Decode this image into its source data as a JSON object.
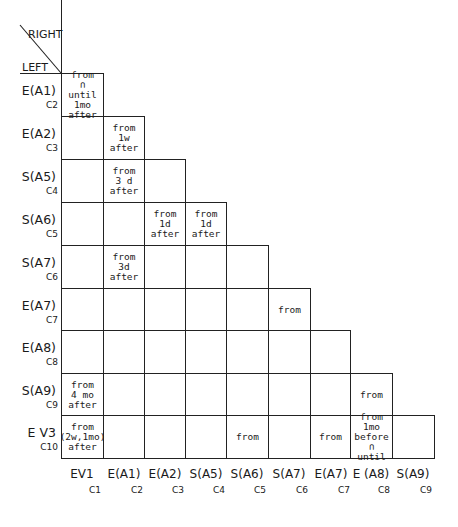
{
  "corner": {
    "right_label": "RIGHT",
    "left_label": "LEFT"
  },
  "rows": [
    {
      "label": "E(A1)",
      "sub": "C2"
    },
    {
      "label": "E(A2)",
      "sub": "C3"
    },
    {
      "label": "S(A5)",
      "sub": "C4"
    },
    {
      "label": "S(A6)",
      "sub": "C5"
    },
    {
      "label": "S(A7)",
      "sub": "C6"
    },
    {
      "label": "E(A7)",
      "sub": "C7"
    },
    {
      "label": "E(A8)",
      "sub": "C8"
    },
    {
      "label": "S(A9)",
      "sub": "C9"
    },
    {
      "label": "E V3",
      "sub": "C10"
    }
  ],
  "columns": [
    {
      "label": "EV1",
      "sub": "C1"
    },
    {
      "label": "E(A1)",
      "sub": "C2"
    },
    {
      "label": "E(A2)",
      "sub": "C3"
    },
    {
      "label": "S(A5)",
      "sub": "C4"
    },
    {
      "label": "S(A6)",
      "sub": "C5"
    },
    {
      "label": "S(A7)",
      "sub": "C6"
    },
    {
      "label": "E(A7)",
      "sub": "C7"
    },
    {
      "label": "E (A8)",
      "sub": "C8"
    },
    {
      "label": "S(A9)",
      "sub": "C9"
    }
  ],
  "cells": {
    "r0c0": "from\n∩\nuntil 1mo\nafter",
    "r1c1": "from 1w\nafter",
    "r2c1": "from\n3 d\nafter",
    "r3c2": "from\n1d\nafter",
    "r3c3": "from\n1d\nafter",
    "r4c1": "from\n3d\nafter",
    "r5c5": "from",
    "r7c0": "from\n4 mo\nafter",
    "r7c7": "from",
    "r8c0": "from\n(2w,1mo)\nafter",
    "r8c4": "from",
    "r8c6": "from",
    "r8c7": "from 1mo\nbefore\n∩\nuntil"
  }
}
